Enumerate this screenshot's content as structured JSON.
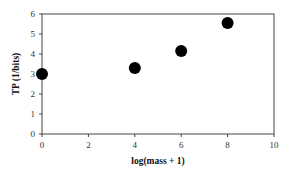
{
  "chart_data": {
    "type": "scatter",
    "title": "",
    "xlabel": "log(mass + 1)",
    "ylabel": "TP (1/bits)",
    "xlim": [
      0,
      10
    ],
    "ylim": [
      0,
      6
    ],
    "xticks": [
      "0",
      "2",
      "4",
      "6",
      "8",
      "10"
    ],
    "yticks": [
      "0",
      "1",
      "2",
      "3",
      "4",
      "5",
      "6"
    ],
    "grid": false,
    "legend": null,
    "series": [
      {
        "name": "TP",
        "marker": "filled-circle",
        "color": "#000000",
        "x": [
          0,
          4,
          6,
          8
        ],
        "y": [
          3.0,
          3.3,
          4.15,
          5.55
        ]
      }
    ]
  },
  "colors": {
    "axis": "#444444",
    "marker": "#000000",
    "background": "#ffffff"
  }
}
